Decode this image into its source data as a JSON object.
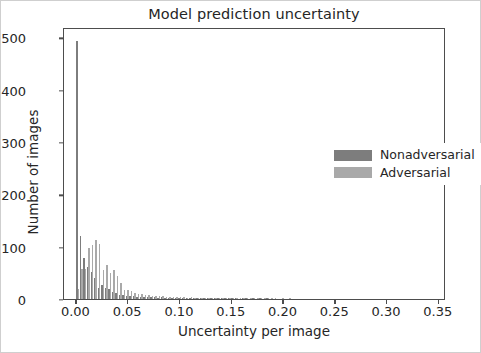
{
  "chart_data": {
    "type": "bar",
    "title": "Model prediction uncertainty",
    "xlabel": "Uncertainty per image",
    "ylabel": "Number of images",
    "xlim": [
      -0.012,
      0.357
    ],
    "ylim": [
      0,
      520
    ],
    "grid": false,
    "legend_position": "center right",
    "xticks": [
      0.0,
      0.05,
      0.1,
      0.15,
      0.2,
      0.25,
      0.3,
      0.35
    ],
    "xtick_labels": [
      "0.00",
      "0.05",
      "0.10",
      "0.15",
      "0.20",
      "0.25",
      "0.30",
      "0.35"
    ],
    "yticks": [
      0,
      100,
      200,
      300,
      400,
      500
    ],
    "ytick_labels": [
      "0",
      "100",
      "200",
      "300",
      "400",
      "500"
    ],
    "bin_width": 0.0034,
    "colors": {
      "nonadversarial": "#7d7d7d",
      "adversarial": "#a9a9a9"
    },
    "series": [
      {
        "name": "Nonadversarial",
        "color": "#7d7d7d",
        "x": [
          0.0017,
          0.0051,
          0.0085,
          0.0119,
          0.0153,
          0.0187,
          0.0221,
          0.0255,
          0.0289,
          0.0323,
          0.0357,
          0.0391,
          0.0425,
          0.0459,
          0.0493,
          0.0527,
          0.0561,
          0.0595,
          0.0629,
          0.0663,
          0.0697,
          0.0731,
          0.0765,
          0.0799,
          0.0833,
          0.0867,
          0.0901,
          0.0935,
          0.0969,
          0.1003,
          0.1037,
          0.1071,
          0.1105,
          0.1139,
          0.1173,
          0.1207,
          0.1241,
          0.1275,
          0.1309,
          0.1343,
          0.1377,
          0.1411,
          0.1445,
          0.1479,
          0.1513,
          0.1547,
          0.1581,
          0.1615,
          0.1649,
          0.1683,
          0.1717,
          0.1751,
          0.1785,
          0.1819,
          0.1853,
          0.1887,
          0.1921,
          0.1955,
          0.1989,
          0.2023,
          0.2057,
          0.2091
        ],
        "values": [
          493,
          120,
          78,
          61,
          52,
          40,
          22,
          26,
          21,
          19,
          13,
          11,
          8,
          7,
          6,
          5,
          5,
          4,
          4,
          3,
          4,
          3,
          3,
          2,
          3,
          2,
          2,
          2,
          2,
          1,
          2,
          1,
          1,
          2,
          1,
          1,
          1,
          1,
          1,
          1,
          1,
          1,
          1,
          1,
          1,
          1,
          0,
          1,
          1,
          0,
          1,
          0,
          1,
          0,
          1,
          0,
          0,
          0,
          0,
          0,
          0,
          0
        ]
      },
      {
        "name": "Adversarial",
        "color": "#a9a9a9",
        "x": [
          0.0017,
          0.0051,
          0.0085,
          0.0119,
          0.0153,
          0.0187,
          0.0221,
          0.0255,
          0.0289,
          0.0323,
          0.0357,
          0.0391,
          0.0425,
          0.0459,
          0.0493,
          0.0527,
          0.0561,
          0.0595,
          0.0629,
          0.0663,
          0.0697,
          0.0731,
          0.0765,
          0.0799,
          0.0833,
          0.0867,
          0.0901,
          0.0935,
          0.0969,
          0.1003,
          0.1037,
          0.1071,
          0.1105,
          0.1139,
          0.1173,
          0.1207,
          0.1241,
          0.1275,
          0.1309,
          0.1343,
          0.1377,
          0.1411,
          0.1445,
          0.1479,
          0.1513,
          0.1547,
          0.1581,
          0.1615,
          0.1649,
          0.1683,
          0.1717,
          0.1751,
          0.1785,
          0.1819,
          0.1853,
          0.1887,
          0.1921,
          0.1955,
          0.1989,
          0.2023,
          0.2057,
          0.2091
        ],
        "values": [
          20,
          57,
          58,
          97,
          104,
          113,
          106,
          55,
          65,
          50,
          55,
          44,
          30,
          18,
          17,
          15,
          12,
          10,
          9,
          7,
          8,
          6,
          6,
          5,
          5,
          4,
          4,
          3,
          4,
          3,
          3,
          2,
          3,
          2,
          2,
          2,
          2,
          1,
          2,
          1,
          2,
          1,
          1,
          1,
          1,
          1,
          1,
          1,
          1,
          1,
          1,
          1,
          1,
          1,
          1,
          1,
          1,
          0,
          1,
          0,
          1,
          0
        ]
      }
    ]
  }
}
